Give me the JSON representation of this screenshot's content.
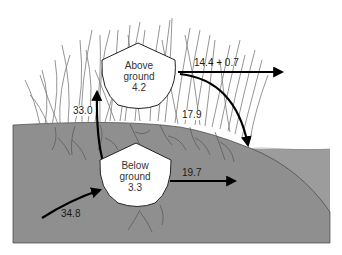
{
  "diagram": {
    "type": "flow-diagram",
    "colors": {
      "soil": "#8f8f8f",
      "water": "#9c9c9c",
      "grass": "#7a7a7a",
      "roots": "#555555",
      "arrow": "#000000",
      "node_fill": "#ffffff",
      "node_stroke": "#222222"
    },
    "nodes": [
      {
        "id": "above",
        "line1": "Above",
        "line2": "ground",
        "value": "4.2"
      },
      {
        "id": "below",
        "line1": "Below",
        "line2": "ground",
        "value": "3.3"
      }
    ],
    "flows": [
      {
        "id": "input",
        "from": "outside",
        "to": "below",
        "label": "34.8"
      },
      {
        "id": "up",
        "from": "below",
        "to": "above",
        "label": "33.0"
      },
      {
        "id": "above-export",
        "from": "above",
        "to": "outside",
        "label": "14.4 + 0.7"
      },
      {
        "id": "above-to-water",
        "from": "above",
        "to": "water",
        "label": "17.9"
      },
      {
        "id": "below-export",
        "from": "below",
        "to": "outside",
        "label": "19.7"
      }
    ]
  }
}
